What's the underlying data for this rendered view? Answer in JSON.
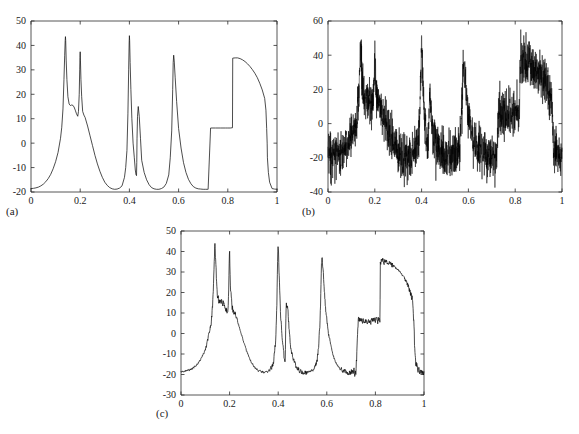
{
  "figure": {
    "background": "#ffffff",
    "line_color": "#111111",
    "axis_color": "#2b2b2b",
    "panel_captions": {
      "a": "(a)",
      "b": "(b)",
      "c": "(c)"
    }
  },
  "chart_data": [
    {
      "id": "panel-a",
      "type": "line",
      "title": "",
      "subtitle": "",
      "caption": "(a)",
      "xlabel": "",
      "ylabel": "",
      "xlim": [
        0,
        1
      ],
      "ylim": [
        -20,
        50
      ],
      "xticks": [
        0,
        0.2,
        0.4,
        0.6,
        0.8,
        1
      ],
      "xticklabels": [
        "0",
        "0.2",
        "0.4",
        "0.6",
        "0.8",
        "1"
      ],
      "yticks": [
        -20,
        -10,
        0,
        10,
        20,
        30,
        40,
        50
      ],
      "yticklabels": [
        "-20",
        "-10",
        "0",
        "10",
        "20",
        "30",
        "40",
        "50"
      ],
      "grid": false,
      "legend": null,
      "series": [
        {
          "name": "clean signal",
          "x": [
            0.0,
            0.01,
            0.02,
            0.03,
            0.04,
            0.05,
            0.06,
            0.07,
            0.08,
            0.09,
            0.1,
            0.11,
            0.12,
            0.125,
            0.13,
            0.134,
            0.137,
            0.139,
            0.14,
            0.141,
            0.143,
            0.146,
            0.15,
            0.155,
            0.16,
            0.165,
            0.17,
            0.175,
            0.18,
            0.185,
            0.19,
            0.193,
            0.196,
            0.198,
            0.199,
            0.2,
            0.201,
            0.203,
            0.206,
            0.21,
            0.215,
            0.22,
            0.23,
            0.24,
            0.25,
            0.26,
            0.27,
            0.28,
            0.29,
            0.3,
            0.31,
            0.32,
            0.33,
            0.34,
            0.35,
            0.36,
            0.37,
            0.38,
            0.385,
            0.39,
            0.394,
            0.397,
            0.399,
            0.4,
            0.401,
            0.403,
            0.406,
            0.41,
            0.415,
            0.42,
            0.424,
            0.427,
            0.429,
            0.43,
            0.431,
            0.433,
            0.436,
            0.44,
            0.445,
            0.45,
            0.46,
            0.47,
            0.48,
            0.49,
            0.5,
            0.51,
            0.52,
            0.53,
            0.54,
            0.55,
            0.56,
            0.566,
            0.572,
            0.576,
            0.578,
            0.58,
            0.582,
            0.586,
            0.592,
            0.6,
            0.61,
            0.62,
            0.63,
            0.64,
            0.65,
            0.66,
            0.67,
            0.68,
            0.69,
            0.7,
            0.71,
            0.719,
            0.72,
            0.73,
            0.75,
            0.77,
            0.79,
            0.8,
            0.81,
            0.818,
            0.819,
            0.82,
            0.83,
            0.84,
            0.85,
            0.86,
            0.87,
            0.88,
            0.89,
            0.9,
            0.91,
            0.92,
            0.93,
            0.94,
            0.95,
            0.955,
            0.958,
            0.96,
            0.961,
            0.965,
            0.97,
            0.98,
            0.99,
            1.0
          ],
          "y": [
            -18.6,
            -18.5,
            -18.3,
            -18.0,
            -17.5,
            -16.8,
            -15.8,
            -14.5,
            -12.8,
            -10.5,
            -7.6,
            -3.8,
            2.0,
            6.5,
            14.0,
            26.0,
            36.0,
            42.0,
            43.6,
            42.0,
            34.0,
            26.0,
            19.0,
            16.0,
            15.4,
            15.6,
            15.5,
            14.8,
            13.5,
            12.0,
            11.0,
            13.0,
            20.0,
            30.0,
            35.0,
            37.4,
            34.0,
            26.0,
            19.0,
            13.0,
            11.5,
            10.5,
            7.0,
            3.0,
            -1.0,
            -5.0,
            -8.5,
            -11.5,
            -14.0,
            -16.0,
            -17.3,
            -18.2,
            -18.7,
            -18.9,
            -18.8,
            -18.4,
            -17.5,
            -14.0,
            -10.0,
            -3.0,
            12.0,
            30.0,
            41.0,
            44.0,
            42.0,
            33.0,
            22.0,
            10.0,
            0.0,
            -6.0,
            -11.0,
            -13.0,
            -13.3,
            -8.0,
            2.0,
            11.0,
            15.0,
            11.0,
            2.0,
            -7.0,
            -12.0,
            -15.0,
            -17.0,
            -18.2,
            -18.7,
            -18.9,
            -18.9,
            -18.6,
            -18.0,
            -16.5,
            -13.0,
            -6.0,
            5.0,
            22.0,
            33.0,
            36.0,
            34.0,
            27.0,
            17.0,
            6.0,
            -2.0,
            -8.0,
            -12.0,
            -14.8,
            -16.6,
            -17.8,
            -18.4,
            -18.7,
            -18.8,
            -18.9,
            -18.9,
            -18.9,
            -18.9,
            6.2,
            6.2,
            6.2,
            6.2,
            6.2,
            6.2,
            6.3,
            6.3,
            34.8,
            34.9,
            34.9,
            34.6,
            34.1,
            33.4,
            32.5,
            31.4,
            30.1,
            28.6,
            26.8,
            24.5,
            21.8,
            18.3,
            13.5,
            6.0,
            0.0,
            -6.0,
            -12.0,
            -16.0,
            -18.6,
            -18.8,
            -18.9,
            -18.9,
            -18.9
          ]
        }
      ]
    },
    {
      "id": "panel-b",
      "type": "line",
      "title": "",
      "subtitle": "",
      "caption": "(b)",
      "xlabel": "",
      "ylabel": "",
      "xlim": [
        0,
        1
      ],
      "ylim": [
        -40,
        60
      ],
      "xticks": [
        0,
        0.2,
        0.4,
        0.6,
        0.8,
        1
      ],
      "xticklabels": [
        "0",
        "0.2",
        "0.4",
        "0.6",
        "0.8",
        "1"
      ],
      "yticks": [
        -40,
        -20,
        0,
        20,
        40,
        60
      ],
      "yticklabels": [
        "-40",
        "-20",
        "0",
        "20",
        "40",
        "60"
      ],
      "grid": false,
      "legend": null,
      "noise": {
        "description": "heavy additive white noise on the panel (a) signal",
        "approx_amplitude": 11,
        "samples": 2048,
        "seed": 7
      },
      "series": [
        {
          "name": "noisy signal",
          "note": "same underlying signal as panel (a), corrupted by additive noise of roughly +/-11 units"
        }
      ]
    },
    {
      "id": "panel-c",
      "type": "line",
      "title": "",
      "subtitle": "",
      "caption": "(c)",
      "xlabel": "",
      "ylabel": "",
      "xlim": [
        0,
        1
      ],
      "ylim": [
        -30,
        50
      ],
      "xticks": [
        0,
        0.2,
        0.4,
        0.6,
        0.8,
        1
      ],
      "xticklabels": [
        "0",
        "0.2",
        "0.4",
        "0.6",
        "0.8",
        "1"
      ],
      "yticks": [
        -30,
        -20,
        -10,
        0,
        10,
        20,
        30,
        40,
        50
      ],
      "yticklabels": [
        "-30",
        "-20",
        "-10",
        "0",
        "10",
        "20",
        "30",
        "40",
        "50"
      ],
      "grid": false,
      "legend": null,
      "noise": {
        "description": "residual low-amplitude ripple after denoising",
        "approx_amplitude": 1.8,
        "samples": 1024,
        "seed": 3
      },
      "series": [
        {
          "name": "denoised estimate",
          "note": "reconstruction of the panel (a) signal from the noisy panel (b) data; small ripples remain near discontinuities"
        }
      ]
    }
  ]
}
